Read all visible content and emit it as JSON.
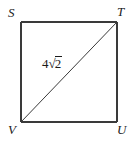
{
  "figure": {
    "type": "geometry-diagram",
    "shape": "square",
    "background_color": "#ffffff",
    "stroke_color": "#3a3a3a",
    "text_color": "#1a1a1a",
    "vertices": [
      {
        "id": "S",
        "label": "S",
        "position": "top-left",
        "x": 21,
        "y": 22
      },
      {
        "id": "T",
        "label": "T",
        "position": "top-right",
        "x": 117,
        "y": 22
      },
      {
        "id": "U",
        "label": "U",
        "position": "bottom-right",
        "x": 117,
        "y": 122
      },
      {
        "id": "V",
        "label": "V",
        "position": "bottom-left",
        "x": 21,
        "y": 122
      }
    ],
    "edges": [
      {
        "from": "S",
        "to": "T"
      },
      {
        "from": "T",
        "to": "U"
      },
      {
        "from": "U",
        "to": "V"
      },
      {
        "from": "V",
        "to": "S"
      }
    ],
    "diagonal": {
      "from": "V",
      "to": "T",
      "measure": {
        "coefficient": "4",
        "radical_sign": "√",
        "radicand": "2",
        "full_text": "4√2"
      }
    }
  }
}
